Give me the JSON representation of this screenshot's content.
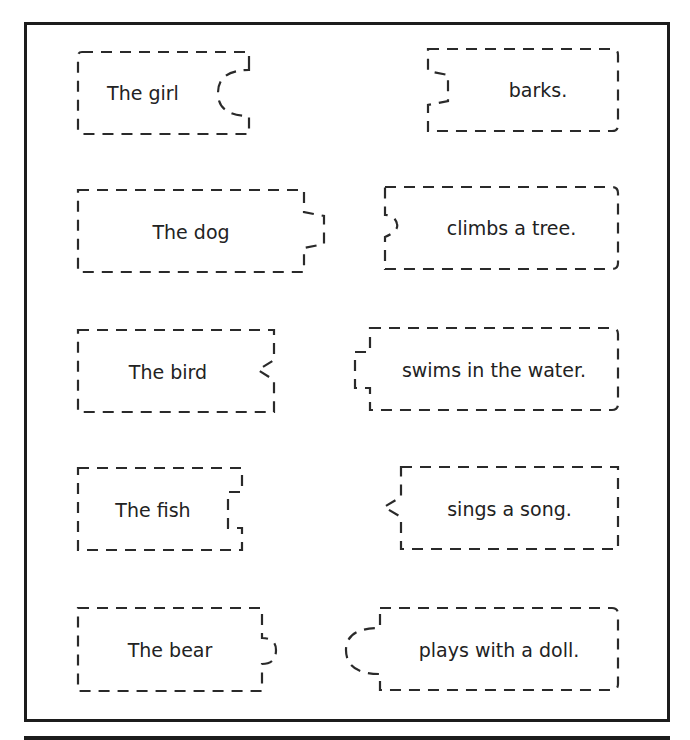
{
  "worksheet": {
    "subject_pieces": [
      {
        "id": "girl",
        "label": "The girl",
        "connector": "round-socket"
      },
      {
        "id": "dog",
        "label": "The dog",
        "connector": "trapezoid-tab"
      },
      {
        "id": "bird",
        "label": "The bird",
        "connector": "triangle-notch"
      },
      {
        "id": "fish",
        "label": "The fish",
        "connector": "square-socket"
      },
      {
        "id": "bear",
        "label": "The bear",
        "connector": "small-round-tab"
      }
    ],
    "predicate_pieces": [
      {
        "id": "barks",
        "label": "barks.",
        "connector": "trapezoid-socket"
      },
      {
        "id": "climbs",
        "label": "climbs a tree.",
        "connector": "small-round-socket"
      },
      {
        "id": "swims",
        "label": "swims in the water.",
        "connector": "square-tab"
      },
      {
        "id": "sings",
        "label": "sings a song.",
        "connector": "triangle-tab"
      },
      {
        "id": "plays",
        "label": "plays with a doll.",
        "connector": "round-tab"
      }
    ],
    "colors": {
      "line": "#2a2a2a",
      "frame": "#1c1c1c",
      "text": "#222222",
      "background": "#ffffff"
    }
  }
}
